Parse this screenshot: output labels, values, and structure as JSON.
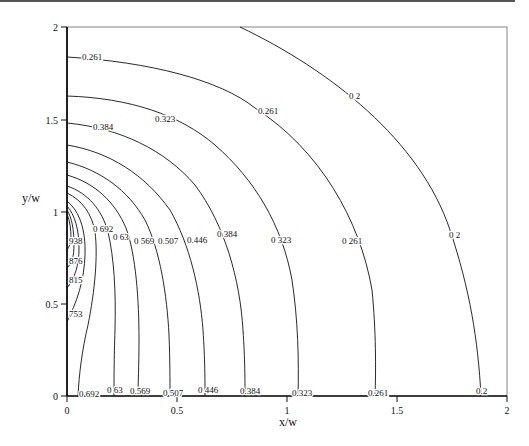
{
  "chart_data": {
    "type": "contour",
    "title": "",
    "xlabel": "x/w",
    "ylabel": "y/w",
    "xlim": [
      0,
      2
    ],
    "ylim": [
      0,
      2
    ],
    "x_ticks": [
      "0",
      "0.5",
      "1",
      "1.5",
      "2"
    ],
    "y_ticks": [
      "0",
      "0.5",
      "1",
      "1.5",
      "2"
    ],
    "grid": false,
    "legend": null,
    "contour_levels": [
      0.2,
      0.261,
      0.323,
      0.384,
      0.446,
      0.507,
      0.569,
      0.63,
      0.692,
      0.753,
      0.815,
      0.876,
      0.938
    ],
    "contours": [
      {
        "level": "0.2",
        "x_at_y0": 1.88,
        "y_at_x0": null,
        "top_x_at_y2": 0.78,
        "labels": [
          [
            0.2,
            "0 2",
            [
              448,
              235
            ]
          ],
          [
            0.2,
            "0 2",
            [
              482,
              394
            ]
          ],
          [
            0.2,
            "0 2",
            [
              349,
              97
            ]
          ]
        ]
      },
      {
        "level": "0.261",
        "x_at_y0": 1.4,
        "y_at_x0": 1.84
      },
      {
        "level": "0.323",
        "x_at_y0": 1.04,
        "y_at_x0": 1.63
      },
      {
        "level": "0.384",
        "x_at_y0": 0.8,
        "y_at_x0": 1.48
      },
      {
        "level": "0.446",
        "x_at_y0": 0.62,
        "y_at_x0": 1.36
      },
      {
        "level": "0.507",
        "x_at_y0": 0.47,
        "y_at_x0": 1.27
      },
      {
        "level": "0.569",
        "x_at_y0": 0.33,
        "y_at_x0": 1.2
      },
      {
        "level": "0.63",
        "x_at_y0": 0.22,
        "y_at_x0": 1.14
      },
      {
        "level": "0.692",
        "x_at_y0": 0.05,
        "y_at_x0": 1.1
      },
      {
        "level": "0.753",
        "x_at_y0": null,
        "y_range_at_x0": [
          0.5,
          1.06
        ]
      },
      {
        "level": "0.815",
        "x_at_y0": null,
        "y_range_at_x0": [
          0.62,
          1.03
        ]
      },
      {
        "level": "0.876",
        "x_at_y0": null,
        "y_range_at_x0": [
          0.72,
          1.01
        ]
      },
      {
        "level": "0.938",
        "x_at_y0": null,
        "y_range_at_x0": [
          0.82,
          0.98
        ]
      }
    ]
  },
  "axes": {
    "xlabel": "x/w",
    "ylabel": "y/w",
    "x_ticks": [
      {
        "label": "0",
        "px": 67
      },
      {
        "label": "0.5",
        "px": 177
      },
      {
        "label": "1",
        "px": 287
      },
      {
        "label": "1.5",
        "px": 397
      },
      {
        "label": "2",
        "px": 507
      }
    ],
    "y_ticks": [
      {
        "label": "0",
        "py": 396
      },
      {
        "label": "0.5",
        "py": 304
      },
      {
        "label": "1",
        "py": 212
      },
      {
        "label": "1.5",
        "py": 120
      },
      {
        "label": "2",
        "py": 27
      }
    ]
  },
  "contour_labels": [
    {
      "text": "0.261",
      "x": 82,
      "y": 60
    },
    {
      "text": "0.323",
      "x": 155,
      "y": 122
    },
    {
      "text": "0.261",
      "x": 258,
      "y": 114
    },
    {
      "text": "0 2",
      "x": 349,
      "y": 99
    },
    {
      "text": "0.384",
      "x": 93,
      "y": 130
    },
    {
      "text": "0 692",
      "x": 93,
      "y": 232
    },
    {
      "text": "0 63",
      "x": 113,
      "y": 240
    },
    {
      "text": "0 569",
      "x": 134,
      "y": 244
    },
    {
      "text": "0.507",
      "x": 158,
      "y": 244
    },
    {
      "text": "0.446",
      "x": 187,
      "y": 243
    },
    {
      "text": "0 384",
      "x": 217,
      "y": 237
    },
    {
      "text": "0 323",
      "x": 271,
      "y": 243
    },
    {
      "text": "0 261",
      "x": 342,
      "y": 244
    },
    {
      "text": "0 2",
      "x": 449,
      "y": 238
    },
    {
      "text": "938",
      "x": 69,
      "y": 244
    },
    {
      "text": "876",
      "x": 69,
      "y": 264
    },
    {
      "text": "815",
      "x": 69,
      "y": 283
    },
    {
      "text": "753",
      "x": 69,
      "y": 317
    },
    {
      "text": "0 692",
      "x": 79,
      "y": 397
    },
    {
      "text": "0 63",
      "x": 107,
      "y": 393
    },
    {
      "text": "0.569",
      "x": 130,
      "y": 394
    },
    {
      "text": "0 507",
      "x": 163,
      "y": 396
    },
    {
      "text": "0 446",
      "x": 198,
      "y": 393
    },
    {
      "text": "0.384",
      "x": 240,
      "y": 394
    },
    {
      "text": "0.323",
      "x": 292,
      "y": 396
    },
    {
      "text": "0.261",
      "x": 368,
      "y": 396
    },
    {
      "text": "0.2",
      "x": 476,
      "y": 394
    }
  ]
}
